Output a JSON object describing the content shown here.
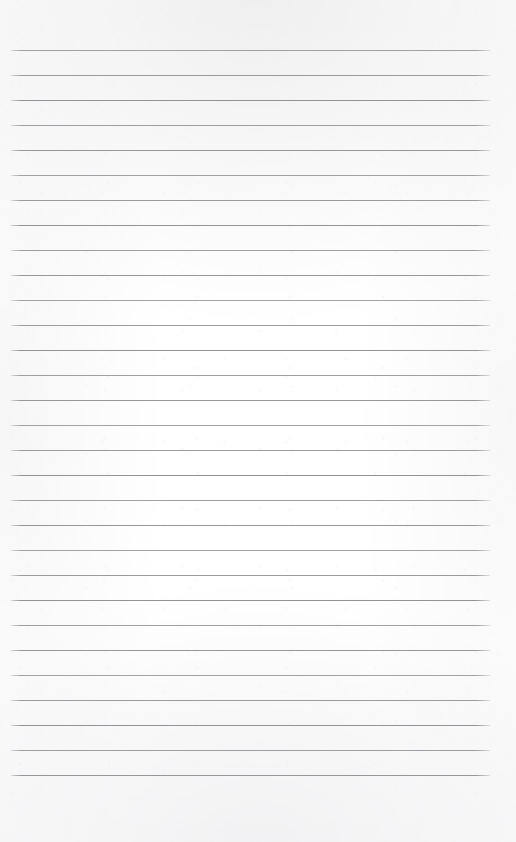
{
  "document": {
    "type": "lined-notebook-page",
    "title": "",
    "content_text": "",
    "is_blank": true
  },
  "page": {
    "width_px": 516,
    "height_px": 842,
    "background_color": "#fefefe",
    "paper_tint_color": "#fdfdfd"
  },
  "ruling": {
    "style": "horizontal-ruled",
    "line_color": "#8e9094",
    "line_thickness_px": 1,
    "line_count": 30,
    "line_spacing_px": 25,
    "first_line_y_px": 50,
    "last_line_y_px": 775,
    "line_start_x_px": 11,
    "line_end_x_px": 490,
    "line_length_px": 479,
    "has_vertical_margin_rule": false,
    "line_y_positions": [
      50,
      75,
      100,
      125,
      150,
      175,
      200,
      225,
      250,
      275,
      300,
      325,
      350,
      375,
      400,
      425,
      450,
      475,
      500,
      525,
      550,
      575,
      600,
      625,
      650,
      675,
      700,
      725,
      750,
      775
    ]
  },
  "margins": {
    "top_px": 50,
    "bottom_px": 67,
    "left_px": 11,
    "right_px": 26
  },
  "writing_area": {
    "x_px": 11,
    "y_px": 50,
    "width_px": 479,
    "height_px": 725,
    "placeholder": ""
  }
}
